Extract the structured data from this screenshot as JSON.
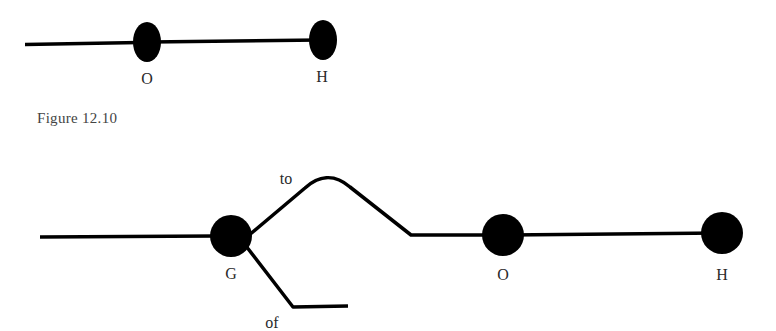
{
  "figure_top": {
    "nodes": [
      {
        "id": "O",
        "label": "O",
        "cx": 147,
        "cy": 42,
        "rx": 14,
        "ry": 20
      },
      {
        "id": "H",
        "label": "H",
        "cx": 323,
        "cy": 40,
        "rx": 14,
        "ry": 20
      }
    ],
    "labels": {
      "O": "O",
      "H": "H"
    }
  },
  "caption": "Figure 12.10",
  "figure_bottom": {
    "nodes": [
      {
        "id": "G",
        "label": "G"
      },
      {
        "id": "O",
        "label": "O"
      },
      {
        "id": "H",
        "label": "H"
      }
    ],
    "branch_labels": {
      "upper": "to",
      "lower": "of"
    },
    "labels": {
      "G": "G",
      "O": "O",
      "H": "H"
    }
  },
  "colors": {
    "stroke": "#000000",
    "node_fill": "#000000",
    "text": "#2a2a2a"
  }
}
